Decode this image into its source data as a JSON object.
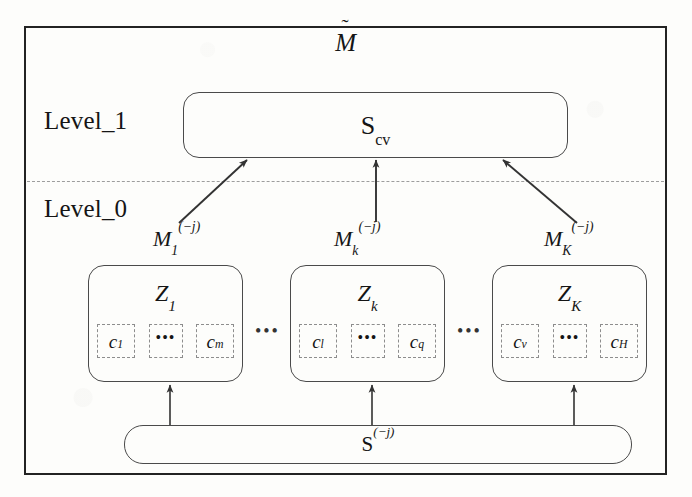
{
  "diagram": {
    "title_base": "M",
    "title_accent": "˜",
    "type": "hierarchical-stacking-architecture",
    "frame": {
      "border_color": "#232323"
    },
    "levels": [
      {
        "id": "level_1",
        "label": "Level_1"
      },
      {
        "id": "level_0",
        "label": "Level_0"
      }
    ],
    "divider": {
      "style": "dashed",
      "color": "#9d9d9d"
    },
    "level_1": {
      "box": {
        "name": "scv-box",
        "label": "S",
        "subscript": "cv",
        "full_label": "S_cv",
        "border_color": "#4a4a4a",
        "fill": "#fdfdfb"
      }
    },
    "level_0": {
      "model_labels": [
        {
          "base": "M",
          "subscript": "1",
          "superscript": "(−j)",
          "full_label": "M_1^(−j)"
        },
        {
          "base": "M",
          "subscript": "k",
          "superscript": "(−j)",
          "full_label": "M_k^(−j)"
        },
        {
          "base": "M",
          "subscript": "K",
          "superscript": "(−j)",
          "full_label": "M_K^(−j)"
        }
      ],
      "groups": [
        {
          "name": "zbox-1",
          "base": "Z",
          "subscript": "1",
          "full_label": "Z_1",
          "cells": [
            {
              "base": "c",
              "subscript": "1",
              "full_label": "c_1"
            },
            {
              "base": "•••",
              "subscript": "",
              "full_label": "..."
            },
            {
              "base": "c",
              "subscript": "m",
              "full_label": "c_m"
            }
          ]
        },
        {
          "name": "zbox-2",
          "base": "Z",
          "subscript": "k",
          "full_label": "Z_k",
          "cells": [
            {
              "base": "c",
              "subscript": "l",
              "full_label": "c_l"
            },
            {
              "base": "•••",
              "subscript": "",
              "full_label": "..."
            },
            {
              "base": "c",
              "subscript": "q",
              "full_label": "c_q"
            }
          ]
        },
        {
          "name": "zbox-3",
          "base": "Z",
          "subscript": "K",
          "full_label": "Z_K",
          "cells": [
            {
              "base": "c",
              "subscript": "v",
              "full_label": "c_v"
            },
            {
              "base": "•••",
              "subscript": "",
              "full_label": "..."
            },
            {
              "base": "c",
              "subscript": "H",
              "full_label": "c_H"
            }
          ]
        }
      ],
      "group_separators": [
        "•••",
        "•••"
      ],
      "source_box": {
        "name": "sj-box",
        "label": "S",
        "superscript": "(−j)",
        "full_label": "S^(−j)",
        "border_color": "#4a4a4a"
      }
    },
    "arrows": {
      "to_scv": [
        {
          "from": "M_1^(−j)",
          "to": "S_cv",
          "style": "diagonal"
        },
        {
          "from": "M_k^(−j)",
          "to": "S_cv",
          "style": "vertical"
        },
        {
          "from": "M_K^(−j)",
          "to": "S_cv",
          "style": "diagonal"
        }
      ],
      "from_sj": [
        {
          "from": "S^(−j)",
          "to": "Z_1",
          "style": "vertical"
        },
        {
          "from": "S^(−j)",
          "to": "Z_k",
          "style": "vertical"
        },
        {
          "from": "S^(−j)",
          "to": "Z_K",
          "style": "vertical"
        }
      ],
      "color": "#333333"
    }
  }
}
